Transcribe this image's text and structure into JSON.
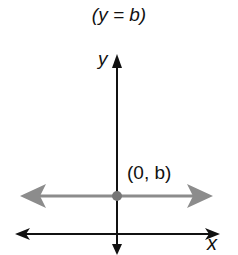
{
  "title": "(y = b)",
  "axes": {
    "x_label": "x",
    "y_label": "y"
  },
  "point": {
    "label": "(0, b)",
    "x": 0,
    "y": "b"
  },
  "line": {
    "equation": "y = b",
    "type": "horizontal"
  },
  "colors": {
    "axis": "#111111",
    "line": "#8c8c8c",
    "point": "#777777"
  }
}
